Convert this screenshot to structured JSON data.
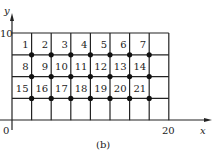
{
  "figure": {
    "caption": "(b)",
    "axes": {
      "x_label": "x",
      "y_label": "y",
      "origin_label": "0",
      "x_tick_label": "20",
      "y_tick_label": "10"
    },
    "grid": {
      "columns": 8,
      "rows": 4,
      "cell_numbers": [
        [
          "1",
          "2",
          "3",
          "4",
          "5",
          "6",
          "7",
          ""
        ],
        [
          "8",
          "9",
          "10",
          "11",
          "12",
          "13",
          "14",
          ""
        ],
        [
          "15",
          "16",
          "17",
          "18",
          "19",
          "20",
          "21",
          ""
        ],
        [
          "",
          "",
          "",
          "",
          "",
          "",
          "",
          ""
        ]
      ],
      "node_rows": 3,
      "node_columns": 7
    }
  }
}
